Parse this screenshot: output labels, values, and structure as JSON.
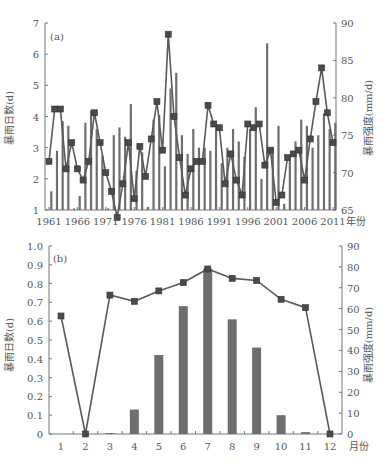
{
  "chart_data": [
    {
      "id": "a",
      "panel_label": "(a)",
      "type": "bar+line",
      "xlabel": "年份",
      "ylabel_left": "暴雨日数(d)",
      "ylabel_right": "暴雨强度(mm/d)",
      "ylim_left": [
        1,
        7
      ],
      "ylim_right": [
        65,
        90
      ],
      "yticks_left": [
        1,
        2,
        3,
        4,
        5,
        6,
        7
      ],
      "yticks_right": [
        65,
        70,
        75,
        80,
        85,
        90
      ],
      "xtick_labels": [
        "1961",
        "1966",
        "1971",
        "1976",
        "1981",
        "1986",
        "1991",
        "1996",
        "2001",
        "2006",
        "2011"
      ],
      "x": [
        1961,
        1962,
        1963,
        1964,
        1965,
        1966,
        1967,
        1968,
        1969,
        1970,
        1971,
        1972,
        1973,
        1974,
        1975,
        1976,
        1977,
        1978,
        1979,
        1980,
        1981,
        1982,
        1983,
        1984,
        1985,
        1986,
        1987,
        1988,
        1989,
        1990,
        1991,
        1992,
        1993,
        1994,
        1995,
        1996,
        1997,
        1998,
        1999,
        2000,
        2001,
        2002,
        2003,
        2004,
        2005,
        2006,
        2007,
        2008,
        2009,
        2010,
        2011
      ],
      "series": [
        {
          "name": "暴雨日数",
          "kind": "bar",
          "axis": "left",
          "values": [
            1.6,
            2.9,
            3.85,
            3.7,
            1.05,
            1.45,
            3.8,
            4.2,
            3.6,
            2.75,
            1.05,
            3.4,
            3.65,
            3.35,
            4.4,
            2.25,
            2.85,
            1.1,
            3.9,
            4.05,
            2.4,
            4.9,
            5.4,
            3.4,
            2.8,
            3.6,
            3.0,
            3.0,
            2.9,
            3.7,
            2.5,
            3.0,
            3.6,
            3.2,
            2.7,
            3.6,
            4.3,
            2.0,
            6.35,
            3.0,
            3.7,
            1.2,
            2.6,
            3.2,
            3.9,
            3.7,
            3.0,
            3.4,
            4.1,
            3.6,
            3.8
          ]
        },
        {
          "name": "暴雨强度",
          "kind": "line",
          "axis": "right",
          "values": [
            71.5,
            78.5,
            78.5,
            70.5,
            74.0,
            70.5,
            69.0,
            71.5,
            78.0,
            74.0,
            70.0,
            67.5,
            64.0,
            68.5,
            74.0,
            66.5,
            73.5,
            69.5,
            74.5,
            79.5,
            73.0,
            88.5,
            77.5,
            72.0,
            67.0,
            70.5,
            71.5,
            71.5,
            79.0,
            76.5,
            76.0,
            68.5,
            72.5,
            69.0,
            67.0,
            76.5,
            76.0,
            76.5,
            71.0,
            73.0,
            66.0,
            67.0,
            72.0,
            72.5,
            73.0,
            69.0,
            74.5,
            79.5,
            84.0,
            78.0,
            74.0
          ]
        }
      ]
    },
    {
      "id": "b",
      "panel_label": "(b)",
      "type": "bar+line",
      "xlabel": "月份",
      "ylabel_left": "暴雨日数(d)",
      "ylabel_right": "暴雨强度(mm/d)",
      "ylim_left": [
        0,
        1.0
      ],
      "ylim_right": [
        0,
        90
      ],
      "yticks_left": [
        "0",
        "0.1",
        "0.2",
        "0.3",
        "0.4",
        "0.5",
        "0.6",
        "0.7",
        "0.8",
        "0.9",
        "1.0"
      ],
      "yticks_right": [
        0,
        10,
        20,
        30,
        40,
        50,
        60,
        70,
        80,
        90
      ],
      "categories": [
        "1",
        "2",
        "3",
        "4",
        "5",
        "6",
        "7",
        "8",
        "9",
        "10",
        "11",
        "12"
      ],
      "series": [
        {
          "name": "暴雨日数",
          "kind": "bar",
          "axis": "left",
          "values": [
            0,
            0,
            0.005,
            0.13,
            0.42,
            0.68,
            0.88,
            0.61,
            0.46,
            0.1,
            0.01,
            0
          ]
        },
        {
          "name": "暴雨强度",
          "kind": "line",
          "axis": "right",
          "values": [
            56.5,
            0,
            66.5,
            63.5,
            68.5,
            72.5,
            79,
            74.5,
            73.5,
            64.5,
            60.5,
            0
          ]
        }
      ]
    }
  ],
  "colors": {
    "bar": "#6e6e6e",
    "line": "#5a5a5a",
    "marker": "#4a4a4a",
    "axis": "#777777",
    "text": "#555555"
  }
}
